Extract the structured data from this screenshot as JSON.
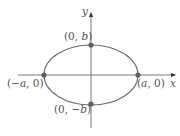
{
  "diagram": {
    "type": "ellipse-on-axes",
    "colors": {
      "background": "#ffffff",
      "curve": "#6b6b6b",
      "axes": "#6b6b6b",
      "points": "#5f5f5f",
      "labels": "#555555"
    },
    "axes": {
      "x_label": "x",
      "y_label": "y"
    },
    "points": [
      {
        "id": "top",
        "label_prefix": "(0, ",
        "label_var": "b",
        "label_suffix": ")"
      },
      {
        "id": "left",
        "label_prefix": "(−",
        "label_var": "a",
        "label_suffix": ", 0)"
      },
      {
        "id": "right",
        "label_prefix": "(",
        "label_var": "a",
        "label_suffix": ", 0)"
      },
      {
        "id": "bottom",
        "label_prefix": "(0, −",
        "label_var": "b",
        "label_suffix": ")"
      }
    ]
  }
}
